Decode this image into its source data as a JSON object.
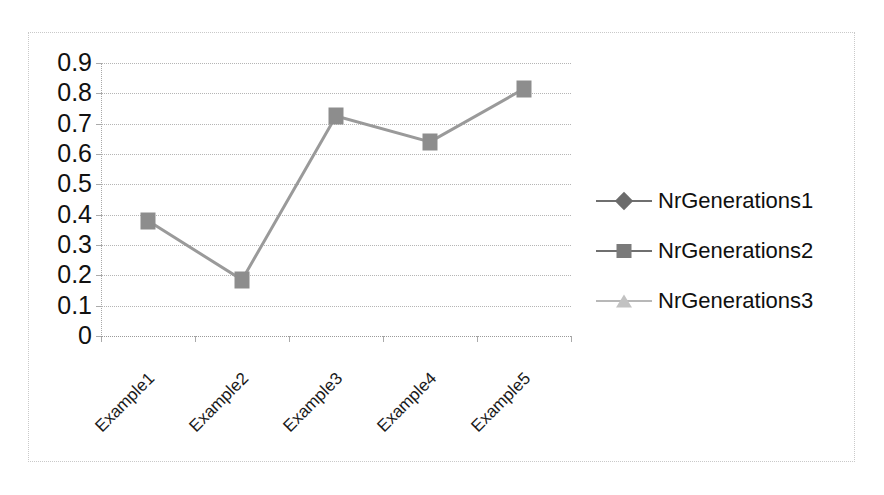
{
  "chart_data": {
    "type": "line",
    "title": "",
    "xlabel": "",
    "ylabel": "",
    "categories": [
      "Example1",
      "Example2",
      "Example3",
      "Example4",
      "Example5"
    ],
    "series": [
      {
        "name": "NrGenerations1",
        "marker": "diamond",
        "color": "#6b6b6b",
        "values": [
          null,
          null,
          null,
          null,
          null
        ]
      },
      {
        "name": "NrGenerations2",
        "marker": "square",
        "color": "#8d8d8d",
        "values": [
          0.38,
          0.185,
          0.725,
          0.64,
          0.815
        ]
      },
      {
        "name": "NrGenerations3",
        "marker": "triangle",
        "color": "#c2c2c2",
        "values": [
          null,
          null,
          null,
          null,
          null
        ]
      }
    ],
    "ylim": [
      0,
      0.9
    ],
    "ytick_labels": [
      "0.9",
      "0.8",
      "0.7",
      "0.6",
      "0.5",
      "0.4",
      "0.3",
      "0.2",
      "0.1",
      "0"
    ],
    "ytick_values": [
      0.9,
      0.8,
      0.7,
      0.6,
      0.5,
      0.4,
      0.3,
      0.2,
      0.1,
      0
    ],
    "grid": true,
    "grid_style": "dotted-horizontal",
    "legend_position": "right",
    "xlabel_rotation": -45
  },
  "frame": {
    "border_color": "#c9c9c9",
    "background": "#ffffff"
  },
  "legend": {
    "entries": [
      {
        "label": "NrGenerations1",
        "marker": "diamond-icon"
      },
      {
        "label": "NrGenerations2",
        "marker": "square-icon"
      },
      {
        "label": "NrGenerations3",
        "marker": "triangle-icon"
      }
    ]
  }
}
